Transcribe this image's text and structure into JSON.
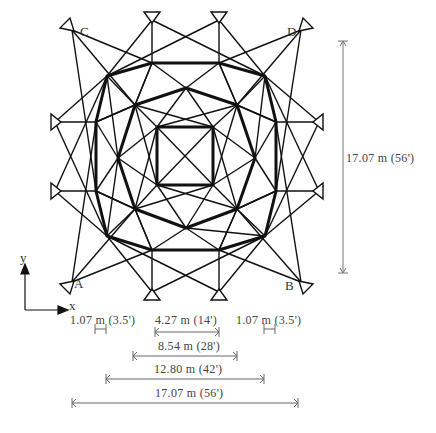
{
  "figure": {
    "corner_labels": {
      "A": "A",
      "B": "B",
      "C": "C",
      "D": "D"
    },
    "axes": {
      "x_label": "x",
      "y_label": "y"
    },
    "vertical_dimension": "17.07 m (56')",
    "horizontal_dimensions": [
      {
        "label": "1.07 m (3.5')",
        "position": "left"
      },
      {
        "label": "4.27 m (14')",
        "position": "center"
      },
      {
        "label": "1.07 m (3.5')",
        "position": "right"
      },
      {
        "label": "8.54 m (28')"
      },
      {
        "label": "12.80 m (42')"
      },
      {
        "label": "17.07 m (56')"
      }
    ]
  },
  "geometry": {
    "inner_square": [
      [
        157,
        127
      ],
      [
        213,
        127
      ],
      [
        213,
        185
      ],
      [
        157,
        185
      ]
    ],
    "middle_octagon": [
      [
        135,
        105
      ],
      [
        186,
        88
      ],
      [
        237,
        105
      ],
      [
        255,
        158
      ],
      [
        237,
        209
      ],
      [
        186,
        228
      ],
      [
        135,
        209
      ],
      [
        118,
        158
      ]
    ],
    "outer_ring": [
      [
        107,
        76
      ],
      [
        152,
        63
      ],
      [
        219,
        63
      ],
      [
        265,
        76
      ],
      [
        276,
        122
      ],
      [
        276,
        191
      ],
      [
        265,
        236
      ],
      [
        219,
        250
      ],
      [
        152,
        250
      ],
      [
        107,
        236
      ],
      [
        96,
        191
      ],
      [
        96,
        122
      ]
    ],
    "supports": {
      "top": [
        [
          152,
          20
        ],
        [
          219,
          20
        ]
      ],
      "bottom": [
        [
          152,
          292
        ],
        [
          219,
          292
        ]
      ],
      "left": [
        [
          55,
          122
        ],
        [
          55,
          191
        ]
      ],
      "right": [
        [
          319,
          122
        ],
        [
          319,
          191
        ]
      ],
      "corners": {
        "C": [
          72,
          30
        ],
        "D": [
          301,
          30
        ],
        "A": [
          72,
          282
        ],
        "B": [
          301,
          282
        ]
      }
    }
  }
}
